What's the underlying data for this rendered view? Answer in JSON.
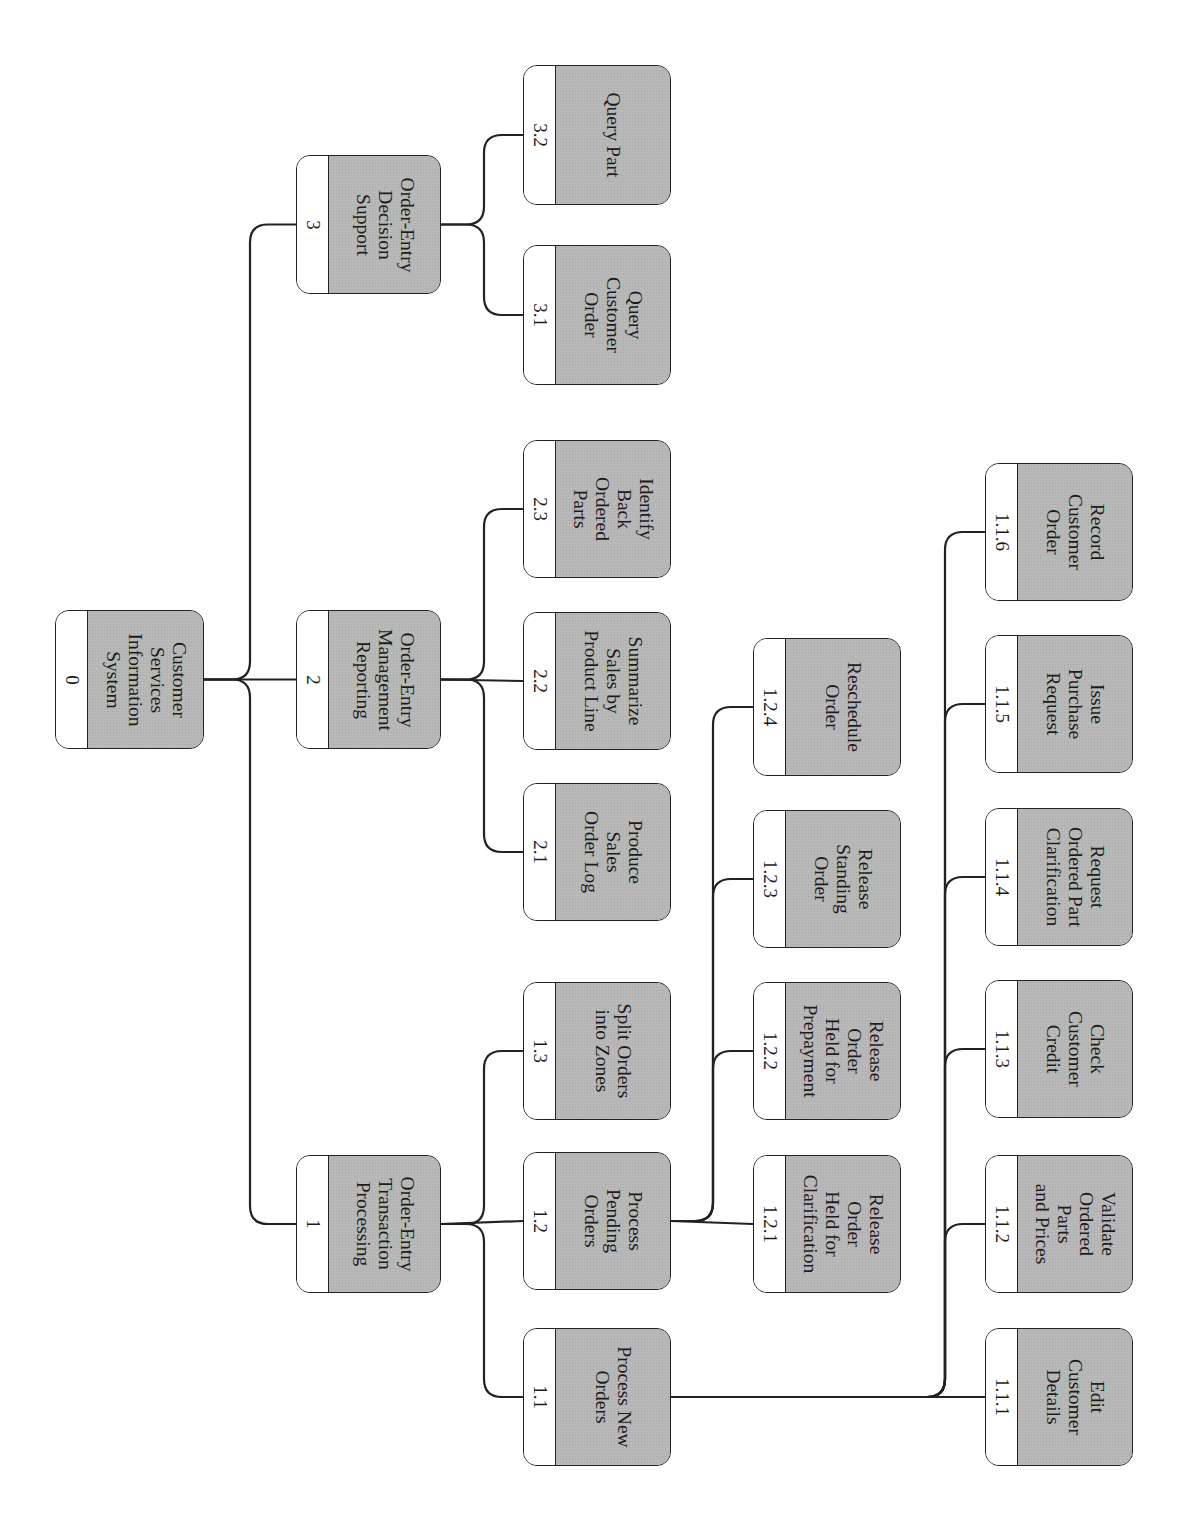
{
  "diagram": {
    "type": "hierarchy-chart",
    "orientation": "rotated-90",
    "colors": {
      "box_fill": "#b8b8b8",
      "id_strip": "#ffffff",
      "stroke": "#222222"
    },
    "nodes": [
      {
        "id": "0",
        "label": "Customer\nServices\nInformation\nSystem",
        "x": 55,
        "y": 610,
        "w": 149,
        "h": 139
      },
      {
        "id": "3",
        "label": "Order-Entry\nDecision\nSupport",
        "x": 296,
        "y": 155,
        "w": 145,
        "h": 139
      },
      {
        "id": "2",
        "label": "Order-Entry\nManagement\nReporting",
        "x": 296,
        "y": 610,
        "w": 145,
        "h": 139
      },
      {
        "id": "1",
        "label": "Order-Entry\nTransaction\nProcessing",
        "x": 296,
        "y": 1155,
        "w": 145,
        "h": 138
      },
      {
        "id": "3.2",
        "label": "Query Part",
        "x": 523,
        "y": 65,
        "w": 148,
        "h": 140
      },
      {
        "id": "3.1",
        "label": "Query\nCustomer\nOrder",
        "x": 523,
        "y": 245,
        "w": 148,
        "h": 140
      },
      {
        "id": "2.3",
        "label": "Identify\nBack\nOrdered\nParts",
        "x": 523,
        "y": 440,
        "w": 148,
        "h": 138
      },
      {
        "id": "2.2",
        "label": "Summarize\nSales by\nProduct Line",
        "x": 523,
        "y": 612,
        "w": 148,
        "h": 138
      },
      {
        "id": "2.1",
        "label": "Produce\nSales\nOrder Log",
        "x": 523,
        "y": 783,
        "w": 148,
        "h": 138
      },
      {
        "id": "1.3",
        "label": "Split Orders\ninto Zones",
        "x": 523,
        "y": 982,
        "w": 148,
        "h": 138
      },
      {
        "id": "1.2",
        "label": "Process\nPending\nOrders",
        "x": 523,
        "y": 1152,
        "w": 148,
        "h": 138
      },
      {
        "id": "1.1",
        "label": "Process New\nOrders",
        "x": 523,
        "y": 1328,
        "w": 148,
        "h": 138
      },
      {
        "id": "1.2.4",
        "label": "Reschedule\nOrder",
        "x": 753,
        "y": 638,
        "w": 148,
        "h": 138
      },
      {
        "id": "1.2.3",
        "label": "Release\nStanding\nOrder",
        "x": 753,
        "y": 810,
        "w": 148,
        "h": 138
      },
      {
        "id": "1.2.2",
        "label": "Release\nOrder\nHeld for\nPrepayment",
        "x": 753,
        "y": 982,
        "w": 148,
        "h": 138
      },
      {
        "id": "1.2.1",
        "label": "Release\nOrder\nHeld for\nClarification",
        "x": 753,
        "y": 1155,
        "w": 148,
        "h": 138
      },
      {
        "id": "1.1.6",
        "label": "Record\nCustomer\nOrder",
        "x": 985,
        "y": 463,
        "w": 148,
        "h": 138
      },
      {
        "id": "1.1.5",
        "label": "Issue\nPurchase\nRequest",
        "x": 985,
        "y": 635,
        "w": 148,
        "h": 138
      },
      {
        "id": "1.1.4",
        "label": "Request\nOrdered Part\nClarification",
        "x": 985,
        "y": 808,
        "w": 148,
        "h": 138
      },
      {
        "id": "1.1.3",
        "label": "Check\nCustomer\nCredit",
        "x": 985,
        "y": 980,
        "w": 148,
        "h": 138
      },
      {
        "id": "1.1.2",
        "label": "Validate\nOrdered\nParts\nand Prices",
        "x": 985,
        "y": 1155,
        "w": 148,
        "h": 138
      },
      {
        "id": "1.1.1",
        "label": "Edit\nCustomer\nDetails",
        "x": 985,
        "y": 1328,
        "w": 148,
        "h": 138
      }
    ],
    "edges": [
      {
        "parent": "0",
        "children": [
          "3",
          "2",
          "1"
        ]
      },
      {
        "parent": "3",
        "children": [
          "3.2",
          "3.1"
        ]
      },
      {
        "parent": "2",
        "children": [
          "2.3",
          "2.2",
          "2.1"
        ]
      },
      {
        "parent": "1",
        "children": [
          "1.3",
          "1.2",
          "1.1"
        ]
      },
      {
        "parent": "1.2",
        "children": [
          "1.2.4",
          "1.2.3",
          "1.2.2",
          "1.2.1"
        ]
      },
      {
        "parent": "1.1",
        "children": [
          "1.1.6",
          "1.1.5",
          "1.1.4",
          "1.1.3",
          "1.1.2",
          "1.1.1"
        ]
      }
    ]
  }
}
